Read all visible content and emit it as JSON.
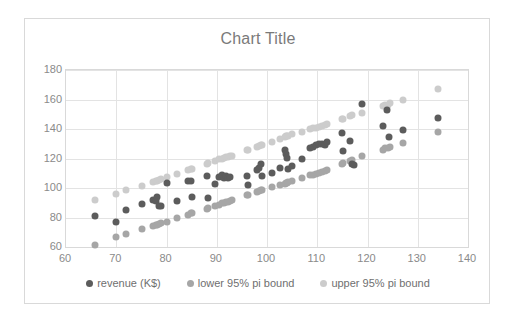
{
  "chart_data": {
    "type": "scatter",
    "title": "Chart Title",
    "xlabel": "",
    "ylabel": "",
    "xlim": [
      60,
      140
    ],
    "ylim": [
      60,
      180
    ],
    "xticks": [
      60,
      70,
      80,
      90,
      100,
      110,
      120,
      130,
      140
    ],
    "yticks": [
      60,
      80,
      100,
      120,
      140,
      160,
      180
    ],
    "grid": true,
    "legend_position": "bottom",
    "colors": {
      "revenue": "#5c5c5c",
      "lower_bound": "#a6a6a6",
      "upper_bound": "#cccccc",
      "gridline": "#e3e3e3",
      "axis_text": "#8a8a8a",
      "title_text": "#7a7a7a",
      "border": "#d9d9d9",
      "background": "#ffffff"
    },
    "series": [
      {
        "name": "revenue (K$)",
        "color": "#5c5c5c",
        "points": [
          [
            65.8,
            80.8
          ],
          [
            69.9,
            77.0
          ],
          [
            72.0,
            85.0
          ],
          [
            75.2,
            89.0
          ],
          [
            77.3,
            92.0
          ],
          [
            77.9,
            91.5
          ],
          [
            78.2,
            94.0
          ],
          [
            78.5,
            88.0
          ],
          [
            79.0,
            87.5
          ],
          [
            80.1,
            103.5
          ],
          [
            82.1,
            91.0
          ],
          [
            84.2,
            105.0
          ],
          [
            84.8,
            104.8
          ],
          [
            85.0,
            94.0
          ],
          [
            88.0,
            108.0
          ],
          [
            88.3,
            93.0
          ],
          [
            89.6,
            103.0
          ],
          [
            90.5,
            107.5
          ],
          [
            91.0,
            108.5
          ],
          [
            91.4,
            106.5
          ],
          [
            91.8,
            108.0
          ],
          [
            92.2,
            107.0
          ],
          [
            92.6,
            107.2
          ],
          [
            96.0,
            108.0
          ],
          [
            96.2,
            102.0
          ],
          [
            98.0,
            112.0
          ],
          [
            98.4,
            113.5
          ],
          [
            98.8,
            116.0
          ],
          [
            99.0,
            108.0
          ],
          [
            101.0,
            110.0
          ],
          [
            102.5,
            113.5
          ],
          [
            103.6,
            126.0
          ],
          [
            103.8,
            123.0
          ],
          [
            104.0,
            120.5
          ],
          [
            104.2,
            113.0
          ],
          [
            105.0,
            115.0
          ],
          [
            107.0,
            120.0
          ],
          [
            108.5,
            127.0
          ],
          [
            109.2,
            128.0
          ],
          [
            109.8,
            129.0
          ],
          [
            110.4,
            129.5
          ],
          [
            111.0,
            129.5
          ],
          [
            111.6,
            129.0
          ],
          [
            112.0,
            131.0
          ],
          [
            115.0,
            137.0
          ],
          [
            115.2,
            125.0
          ],
          [
            116.5,
            132.0
          ],
          [
            117.0,
            116.0
          ],
          [
            117.3,
            115.8
          ],
          [
            119.0,
            157.0
          ],
          [
            123.0,
            142.0
          ],
          [
            123.8,
            153.0
          ],
          [
            124.2,
            134.5
          ],
          [
            127.0,
            139.0
          ],
          [
            134.0,
            147.5
          ]
        ]
      },
      {
        "name": "lower 95% pi bound",
        "color": "#a6a6a6",
        "points": [
          [
            65.8,
            61.5
          ],
          [
            69.9,
            66.5
          ],
          [
            72.0,
            68.8
          ],
          [
            75.2,
            72.0
          ],
          [
            77.3,
            74.5
          ],
          [
            77.9,
            75.0
          ],
          [
            78.2,
            75.2
          ],
          [
            78.5,
            75.4
          ],
          [
            79.0,
            76.0
          ],
          [
            80.1,
            77.0
          ],
          [
            82.1,
            79.5
          ],
          [
            84.2,
            82.0
          ],
          [
            84.8,
            82.8
          ],
          [
            85.0,
            83.0
          ],
          [
            88.0,
            86.0
          ],
          [
            88.3,
            86.3
          ],
          [
            89.6,
            88.0
          ],
          [
            90.5,
            88.8
          ],
          [
            91.0,
            89.5
          ],
          [
            91.4,
            90.0
          ],
          [
            91.8,
            90.4
          ],
          [
            92.2,
            90.8
          ],
          [
            92.6,
            91.2
          ],
          [
            93.0,
            92.0
          ],
          [
            96.0,
            95.0
          ],
          [
            96.2,
            95.2
          ],
          [
            98.0,
            97.5
          ],
          [
            98.4,
            98.0
          ],
          [
            98.8,
            98.4
          ],
          [
            99.0,
            98.6
          ],
          [
            101.0,
            100.5
          ],
          [
            102.5,
            102.0
          ],
          [
            103.6,
            103.0
          ],
          [
            103.8,
            103.2
          ],
          [
            104.0,
            103.5
          ],
          [
            104.2,
            103.8
          ],
          [
            105.0,
            104.5
          ],
          [
            107.0,
            107.0
          ],
          [
            108.5,
            108.5
          ],
          [
            109.2,
            109.0
          ],
          [
            109.8,
            109.8
          ],
          [
            110.4,
            110.5
          ],
          [
            111.0,
            111.0
          ],
          [
            111.6,
            111.5
          ],
          [
            112.0,
            112.5
          ],
          [
            115.0,
            116.5
          ],
          [
            115.2,
            116.8
          ],
          [
            116.5,
            118.5
          ],
          [
            117.0,
            119.0
          ],
          [
            119.0,
            121.5
          ],
          [
            123.0,
            126.0
          ],
          [
            123.5,
            126.8
          ],
          [
            124.0,
            127.0
          ],
          [
            124.4,
            127.5
          ],
          [
            127.0,
            130.5
          ],
          [
            134.0,
            138.0
          ]
        ]
      },
      {
        "name": "upper 95% pi bound",
        "color": "#cccccc",
        "points": [
          [
            65.8,
            92.0
          ],
          [
            69.9,
            96.0
          ],
          [
            72.0,
            98.8
          ],
          [
            75.2,
            101.5
          ],
          [
            77.3,
            104.0
          ],
          [
            77.9,
            104.5
          ],
          [
            78.2,
            105.0
          ],
          [
            78.5,
            105.5
          ],
          [
            79.0,
            106.0
          ],
          [
            80.1,
            107.5
          ],
          [
            82.1,
            109.8
          ],
          [
            84.2,
            112.0
          ],
          [
            84.8,
            112.8
          ],
          [
            85.0,
            113.0
          ],
          [
            88.0,
            116.5
          ],
          [
            88.3,
            116.8
          ],
          [
            89.6,
            118.5
          ],
          [
            90.5,
            119.5
          ],
          [
            91.0,
            120.0
          ],
          [
            91.4,
            120.5
          ],
          [
            91.8,
            120.8
          ],
          [
            92.2,
            121.2
          ],
          [
            92.6,
            121.8
          ],
          [
            93.0,
            122.0
          ],
          [
            96.0,
            125.5
          ],
          [
            96.2,
            125.8
          ],
          [
            98.0,
            128.0
          ],
          [
            98.4,
            128.5
          ],
          [
            98.8,
            129.0
          ],
          [
            99.0,
            129.2
          ],
          [
            101.0,
            131.0
          ],
          [
            102.5,
            133.0
          ],
          [
            103.6,
            134.5
          ],
          [
            103.8,
            135.0
          ],
          [
            104.0,
            135.2
          ],
          [
            104.2,
            135.5
          ],
          [
            105.0,
            136.5
          ],
          [
            107.0,
            138.0
          ],
          [
            108.5,
            140.0
          ],
          [
            109.2,
            140.5
          ],
          [
            109.8,
            141.0
          ],
          [
            110.4,
            141.5
          ],
          [
            111.0,
            142.0
          ],
          [
            111.6,
            142.5
          ],
          [
            112.0,
            143.5
          ],
          [
            115.0,
            146.5
          ],
          [
            115.2,
            146.8
          ],
          [
            116.5,
            149.0
          ],
          [
            117.0,
            149.5
          ],
          [
            119.0,
            151.0
          ],
          [
            123.0,
            155.5
          ],
          [
            123.5,
            156.0
          ],
          [
            124.0,
            156.5
          ],
          [
            124.4,
            157.5
          ],
          [
            127.0,
            159.8
          ],
          [
            134.0,
            167.0
          ]
        ]
      }
    ]
  },
  "legend": {
    "items": [
      {
        "label": "revenue (K$)",
        "color": "#5c5c5c"
      },
      {
        "label": "lower 95% pi bound",
        "color": "#a6a6a6"
      },
      {
        "label": "upper 95% pi bound",
        "color": "#cccccc"
      }
    ]
  }
}
